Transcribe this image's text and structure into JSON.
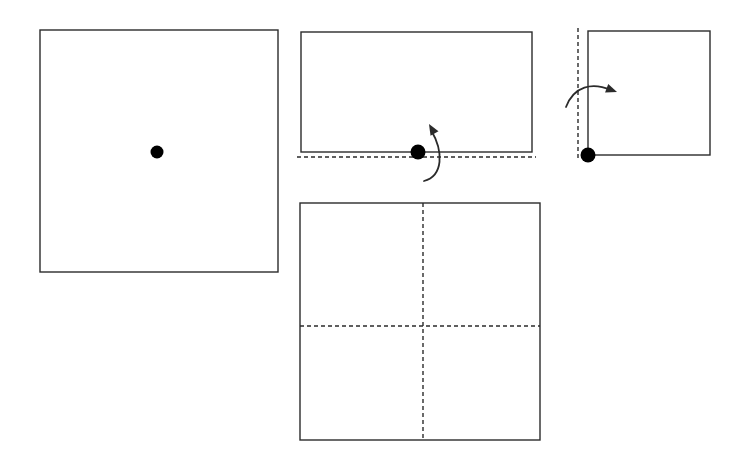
{
  "figure": {
    "canvas": {
      "width": 747,
      "height": 464
    },
    "background_color": "#ffffff",
    "stroke_color": "#2b2b2b",
    "dash_color": "#2b2b2b",
    "dot_color": "#000000",
    "stroke_width": 1.4,
    "dash_width": 1.4,
    "dash_pattern": "4,3",
    "panel_count": 4
  },
  "panels": [
    {
      "id": "panel-1",
      "name": "unfolded-sheet-with-center-dot",
      "step_label": "1",
      "description": "Full square sheet with a single dot marked at its center",
      "rect": {
        "x": 40,
        "y": 30,
        "width": 238,
        "height": 242
      },
      "dots": [
        {
          "name": "center-dot",
          "cx": 157,
          "cy": 152,
          "r": 6.5
        }
      ],
      "dashed_lines": [],
      "arrows": []
    },
    {
      "id": "panel-2",
      "name": "first-fold-bottom-up",
      "step_label": "2",
      "description": "Sheet folded in half upward along a horizontal crease; dot sits on the bottom fold edge; curved arrow indicates the bottom half rotating up",
      "rect": {
        "x": 301,
        "y": 32,
        "width": 231,
        "height": 120
      },
      "dots": [
        {
          "name": "fold-edge-dot",
          "cx": 418,
          "cy": 152,
          "r": 7.5
        }
      ],
      "dashed_lines": [
        {
          "name": "horizontal-crease-line",
          "orientation": "horizontal",
          "x1": 297,
          "y1": 157,
          "x2": 536,
          "y2": 157
        }
      ],
      "arrows": [
        {
          "name": "fold-up-arrow",
          "direction": "up",
          "path": "M 424 181 C 443 176, 444 152, 431 130",
          "head": {
            "tip_x": 429,
            "tip_y": 124,
            "angle_deg": -120
          }
        }
      ]
    },
    {
      "id": "panel-3",
      "name": "second-fold-left-to-right",
      "step_label": "3",
      "description": "Sheet folded again along a vertical crease on the left; dot sits at the bottom-left corner; curved arrow indicates the left half rotating right",
      "rect": {
        "x": 588,
        "y": 31,
        "width": 122,
        "height": 124
      },
      "dots": [
        {
          "name": "corner-dot",
          "cx": 588,
          "cy": 155,
          "r": 7.5
        }
      ],
      "dashed_lines": [
        {
          "name": "vertical-crease-line",
          "orientation": "vertical",
          "x1": 578,
          "y1": 28,
          "x2": 578,
          "y2": 158
        }
      ],
      "arrows": [
        {
          "name": "fold-right-arrow",
          "direction": "right",
          "path": "M 566 107 C 574 86, 592 82, 611 90",
          "head": {
            "tip_x": 617,
            "tip_y": 92,
            "angle_deg": 20
          }
        }
      ]
    },
    {
      "id": "panel-4",
      "name": "unfolded-result-with-creases",
      "step_label": "4",
      "description": "Sheet unfolded again showing both creases as dashed lines dividing it into four quadrants",
      "rect": {
        "x": 300,
        "y": 203,
        "width": 240,
        "height": 237
      },
      "dots": [],
      "dashed_lines": [
        {
          "name": "vertical-crease-line",
          "orientation": "vertical",
          "x1": 423,
          "y1": 203,
          "x2": 423,
          "y2": 440
        },
        {
          "name": "horizontal-crease-line",
          "orientation": "horizontal",
          "x1": 300,
          "y1": 326,
          "x2": 540,
          "y2": 326
        }
      ],
      "arrows": []
    }
  ]
}
